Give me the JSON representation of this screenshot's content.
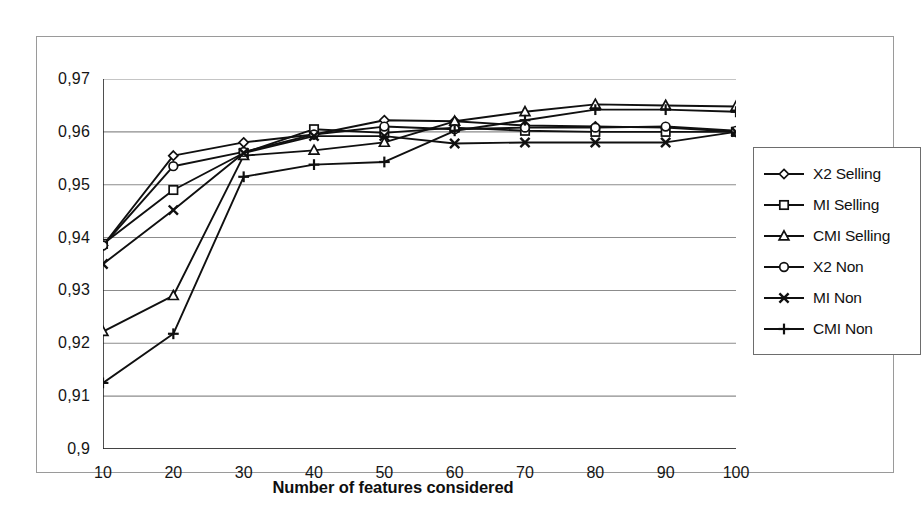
{
  "chart_data": {
    "type": "line",
    "title": "",
    "subtitle": "",
    "xlabel": "Number of features considered",
    "ylabel": "",
    "decimal_separator": ",",
    "grid": "horizontal",
    "legend_position": "right",
    "x": [
      10,
      20,
      30,
      40,
      50,
      60,
      70,
      80,
      90,
      100
    ],
    "categories": [
      "10",
      "20",
      "30",
      "40",
      "50",
      "60",
      "70",
      "80",
      "90",
      "100"
    ],
    "xlim": [
      10,
      100
    ],
    "ylim": [
      0.9,
      0.97
    ],
    "ytick_labels": [
      "0,97",
      "0,96",
      "0,95",
      "0,94",
      "0,93",
      "0,92",
      "0,91",
      "0,9"
    ],
    "ytick_values": [
      0.97,
      0.96,
      0.95,
      0.94,
      0.93,
      0.92,
      0.91,
      0.9
    ],
    "xtick_labels": [
      "10",
      "20",
      "30",
      "40",
      "50",
      "60",
      "70",
      "80",
      "90",
      "100"
    ],
    "series": [
      {
        "name": "X2 Selling",
        "marker": "diamond",
        "color": "#101010",
        "values": [
          0.9385,
          0.9555,
          0.958,
          0.9595,
          0.9622,
          0.962,
          0.9612,
          0.961,
          0.9608,
          0.96
        ]
      },
      {
        "name": "MI Selling",
        "marker": "square",
        "color": "#101010",
        "values": [
          0.9388,
          0.949,
          0.956,
          0.9605,
          0.9598,
          0.9608,
          0.9602,
          0.96,
          0.96,
          0.96
        ]
      },
      {
        "name": "CMI Selling",
        "marker": "triangle",
        "color": "#101010",
        "values": [
          0.9222,
          0.929,
          0.9555,
          0.9565,
          0.958,
          0.962,
          0.9638,
          0.9652,
          0.965,
          0.9648
        ]
      },
      {
        "name": "X2 Non",
        "marker": "circle",
        "color": "#101010",
        "values": [
          0.9385,
          0.9535,
          0.9562,
          0.9595,
          0.961,
          0.9605,
          0.9608,
          0.9608,
          0.961,
          0.9602
        ]
      },
      {
        "name": "MI Non",
        "marker": "cross",
        "color": "#101010",
        "values": [
          0.935,
          0.9452,
          0.956,
          0.9592,
          0.9592,
          0.9578,
          0.958,
          0.958,
          0.958,
          0.96
        ]
      },
      {
        "name": "CMI Non",
        "marker": "plus",
        "color": "#101010",
        "values": [
          0.9125,
          0.9218,
          0.9515,
          0.9538,
          0.9543,
          0.9602,
          0.9622,
          0.9642,
          0.9642,
          0.9638
        ]
      }
    ]
  },
  "legend": {
    "items": [
      {
        "label": "X2 Selling",
        "marker": "diamond"
      },
      {
        "label": "MI Selling",
        "marker": "square"
      },
      {
        "label": "CMI Selling",
        "marker": "triangle"
      },
      {
        "label": "X2 Non",
        "marker": "circle"
      },
      {
        "label": "MI Non",
        "marker": "cross"
      },
      {
        "label": "CMI Non",
        "marker": "plus"
      }
    ]
  },
  "style": {
    "line_color": "#101010",
    "grid_color": "#8c8c8c",
    "axis_color": "#222222",
    "frame_color": "#9a9a9a",
    "background": "#ffffff"
  }
}
